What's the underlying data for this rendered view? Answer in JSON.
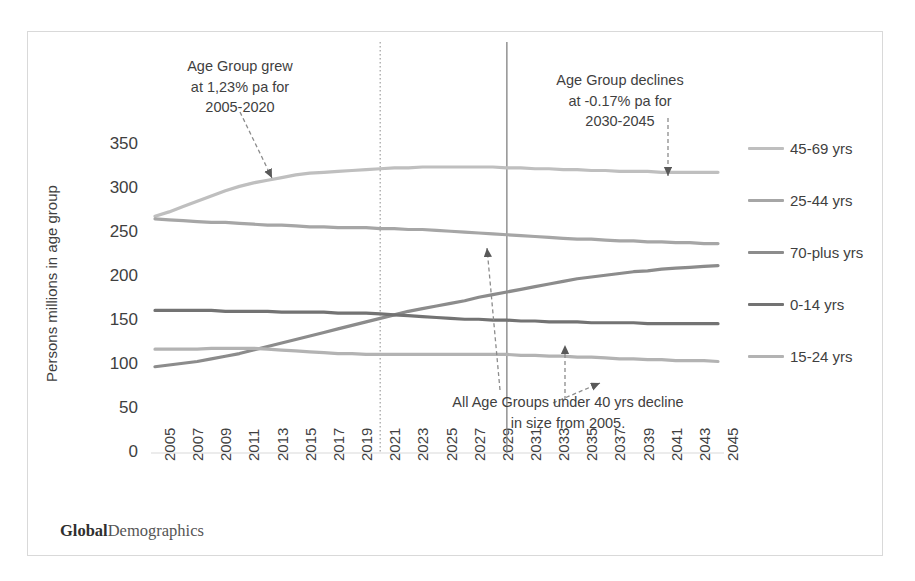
{
  "figure": {
    "brand_bold": "Global",
    "brand_regular": "Demographics",
    "border_color": "#d9d9d9"
  },
  "chart_data": {
    "type": "line",
    "title": "",
    "xlabel": "",
    "ylabel": "Persons millions in age group",
    "ylim": [
      0,
      370
    ],
    "yticks": [
      0,
      50,
      100,
      150,
      200,
      250,
      300,
      350
    ],
    "xlim": [
      2005,
      2045
    ],
    "grid": false,
    "legend_position": "right",
    "x": [
      2005,
      2006,
      2007,
      2008,
      2009,
      2010,
      2011,
      2012,
      2013,
      2014,
      2015,
      2016,
      2017,
      2018,
      2019,
      2020,
      2021,
      2022,
      2023,
      2024,
      2025,
      2026,
      2027,
      2028,
      2029,
      2030,
      2031,
      2032,
      2033,
      2034,
      2035,
      2036,
      2037,
      2038,
      2039,
      2040,
      2041,
      2042,
      2043,
      2044,
      2045
    ],
    "tick_labels": [
      "2005",
      "2007",
      "2009",
      "2011",
      "2013",
      "2015",
      "2017",
      "2019",
      "2021",
      "2023",
      "2025",
      "2027",
      "2029",
      "2031",
      "2033",
      "2035",
      "2037",
      "2039",
      "2041",
      "2043",
      "2045"
    ],
    "series": [
      {
        "name": "45-69 yrs",
        "color": "#bfbfbf",
        "values": [
          269,
          274,
          280,
          286,
          292,
          298,
          303,
          307,
          310,
          313,
          316,
          318,
          319,
          320,
          321,
          322,
          323,
          324,
          324,
          325,
          325,
          325,
          325,
          325,
          325,
          324,
          324,
          323,
          323,
          322,
          322,
          321,
          321,
          320,
          320,
          320,
          319,
          319,
          319,
          319,
          319
        ]
      },
      {
        "name": "25-44 yrs",
        "color": "#a6a6a6",
        "values": [
          266,
          265,
          264,
          263,
          262,
          262,
          261,
          260,
          259,
          259,
          258,
          257,
          257,
          256,
          256,
          256,
          255,
          255,
          254,
          254,
          253,
          252,
          251,
          250,
          249,
          248,
          247,
          246,
          245,
          244,
          243,
          243,
          242,
          241,
          241,
          240,
          240,
          239,
          239,
          238,
          238
        ]
      },
      {
        "name": "70-plus yrs",
        "color": "#8c8c8c",
        "values": [
          98,
          100,
          102,
          104,
          107,
          110,
          113,
          117,
          121,
          125,
          129,
          133,
          137,
          141,
          145,
          149,
          153,
          157,
          161,
          164,
          167,
          170,
          173,
          177,
          180,
          183,
          186,
          189,
          192,
          195,
          198,
          200,
          202,
          204,
          206,
          207,
          209,
          210,
          211,
          212,
          213
        ]
      },
      {
        "name": "0-14 yrs",
        "color": "#737373",
        "values": [
          162,
          162,
          162,
          162,
          162,
          161,
          161,
          161,
          161,
          160,
          160,
          160,
          160,
          159,
          159,
          159,
          158,
          157,
          156,
          155,
          154,
          153,
          152,
          152,
          151,
          151,
          150,
          150,
          149,
          149,
          149,
          148,
          148,
          148,
          148,
          147,
          147,
          147,
          147,
          147,
          147
        ]
      },
      {
        "name": "15-24 yrs",
        "color": "#b3b3b3",
        "values": [
          118,
          118,
          118,
          118,
          119,
          119,
          119,
          119,
          118,
          117,
          116,
          115,
          114,
          113,
          113,
          112,
          112,
          112,
          112,
          112,
          112,
          112,
          112,
          112,
          112,
          112,
          111,
          111,
          110,
          110,
          109,
          109,
          108,
          107,
          107,
          106,
          106,
          105,
          105,
          105,
          104
        ]
      }
    ],
    "reference_lines": [
      {
        "name": "year-2021-dotted",
        "x": 2021,
        "style": "dotted",
        "color": "#a6a6a6"
      },
      {
        "name": "year-2030-solid",
        "x": 2030,
        "style": "solid",
        "color": "#808080"
      }
    ],
    "annotations": [
      {
        "name": "growth-note",
        "text": "Age Group grew\nat 1,23% pa for\n2005-2020",
        "target_year": 2013,
        "target_value": 310
      },
      {
        "name": "decline-note",
        "text": "Age Group declines\nat -0.17% pa for\n2030-2045",
        "target_year": 2040,
        "target_value": 320
      },
      {
        "name": "under-40-note",
        "text": "All Age Groups under 40 yrs decline\nin size from 2005.",
        "target_year": 2027,
        "target_value": 255
      }
    ]
  }
}
